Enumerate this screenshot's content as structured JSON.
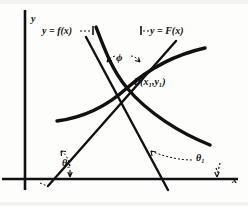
{
  "figure": {
    "background_color": "#fdfdfc",
    "ink_color": "#111111",
    "axes": {
      "y_axis_label": "y",
      "x_axis_label": "x",
      "y_axis": {
        "x": 25,
        "y_top": 10,
        "y_bottom": 190
      },
      "x_axis": {
        "y": 179,
        "x_left": 2,
        "x_right": 238
      }
    },
    "labels": {
      "curve_f": "y = f(x)",
      "curve_F": "y = F(x)",
      "point": "P(x₁,y₁)",
      "angle_phi": "ϕ",
      "angle_theta2": "θ₂",
      "angle_theta1": "θ₁"
    },
    "annotations": {
      "intersection_point": {
        "x": 127,
        "y": 88
      },
      "phi_arc": "dashed arc with arrowheads between the two tangent lines above P",
      "theta2_arc": "dashed arc between left tangent line and x-axis",
      "theta1_arc": "dashed arc between right tangent line and x-axis",
      "leader_f": "dashed leader from y = f(x) label to the rising curve",
      "leader_F": "dashed leader from y = F(x) label to the rising curve"
    },
    "curves": [
      {
        "name": "f(x)",
        "description": "decreasing curve passing through P, flat at left, descending to the right",
        "stroke_width": 3.2,
        "path": "M 57,121 C 80,118 105,108 127,88 C 152,66 178,54 205,48"
      },
      {
        "name": "F(x)",
        "description": "increasing curve passing through P, steep and rising at the top",
        "stroke_width": 3.2,
        "path": "M 96,27 C 104,48 112,70 127,88 C 148,113 180,133 210,145"
      }
    ],
    "tangent_lines": [
      {
        "name": "tangent-left",
        "description": "tangent to one curve through P, making angle theta2 with x-axis, rising to the right",
        "stroke_width": 2.4,
        "x1": 48,
        "y1": 186,
        "x2": 176,
        "y2": 41
      },
      {
        "name": "tangent-right",
        "description": "tangent to the other curve through P, making angle theta1 with x-axis, falling to the right",
        "stroke_width": 2.4,
        "x1": 86,
        "y1": 37,
        "x2": 168,
        "y2": 190
      }
    ]
  }
}
